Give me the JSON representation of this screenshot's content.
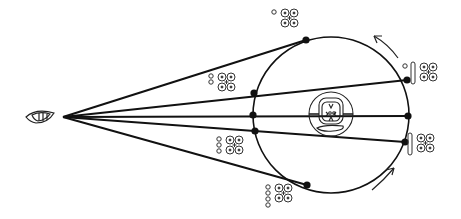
{
  "diagram": {
    "stroke_color": "#111111",
    "background": "#ffffff",
    "observer": {
      "icon": "eye-icon",
      "x": 42,
      "y": 117
    },
    "vertex": {
      "x": 63,
      "y": 117
    },
    "orbit": {
      "cx": 331,
      "cy": 115,
      "r": 78
    },
    "sun_glyph": {
      "icon": "sun-glyph-icon",
      "x": 331,
      "y": 114
    },
    "rays": [
      {
        "to_x": 306,
        "to_y": 40
      },
      {
        "to_x": 407,
        "to_y": 80
      },
      {
        "to_x": 408,
        "to_y": 116
      },
      {
        "to_x": 405,
        "to_y": 142
      },
      {
        "to_x": 307,
        "to_y": 185
      }
    ],
    "points": [
      {
        "x": 306,
        "y": 40
      },
      {
        "x": 407,
        "y": 80
      },
      {
        "x": 254,
        "y": 93
      },
      {
        "x": 253,
        "y": 115
      },
      {
        "x": 408,
        "y": 116
      },
      {
        "x": 255,
        "y": 131
      },
      {
        "x": 405,
        "y": 142
      },
      {
        "x": 307,
        "y": 185
      }
    ],
    "glyph_labels": [
      {
        "icon": "day-sign-glyph-icon",
        "dots": 1,
        "bar": 0,
        "x": 272,
        "y": 8
      },
      {
        "icon": "day-sign-glyph-icon",
        "dots": 2,
        "bar": 0,
        "x": 209,
        "y": 72
      },
      {
        "icon": "day-sign-glyph-icon",
        "dots": 3,
        "bar": 0,
        "x": 217,
        "y": 135
      },
      {
        "icon": "day-sign-glyph-icon",
        "dots": 4,
        "bar": 0,
        "x": 266,
        "y": 183
      },
      {
        "icon": "day-sign-glyph-icon",
        "dots": 1,
        "bar": 1,
        "x": 403,
        "y": 62
      },
      {
        "icon": "day-sign-glyph-icon",
        "dots": 0,
        "bar": 1,
        "x": 408,
        "y": 133
      }
    ],
    "arrows": [
      {
        "icon": "arrow-counterclockwise-icon",
        "position": "top-right"
      },
      {
        "icon": "arrow-counterclockwise-icon",
        "position": "bottom-right"
      }
    ]
  }
}
